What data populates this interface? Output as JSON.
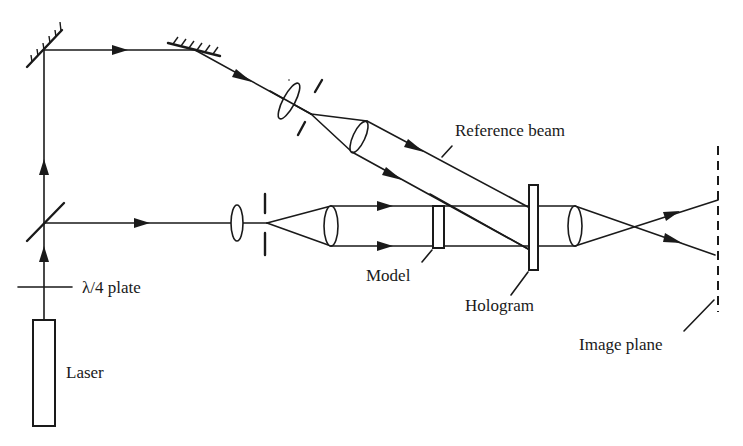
{
  "diagram": {
    "type": "optical-setup",
    "colors": {
      "ink": "#1a1a1a",
      "background": "#ffffff"
    },
    "labels": {
      "reference_beam": "Reference beam",
      "quarter_wave_plate": "λ/4 plate",
      "model": "Model",
      "hologram": "Hologram",
      "image_plane": "Image plane",
      "laser": "Laser"
    },
    "components": [
      {
        "id": "laser",
        "kind": "source",
        "label": "Laser"
      },
      {
        "id": "qwp",
        "kind": "wave-plate",
        "label": "λ/4 plate"
      },
      {
        "id": "beam-splitter",
        "kind": "beam-splitter"
      },
      {
        "id": "mirror-1",
        "kind": "mirror"
      },
      {
        "id": "mirror-2",
        "kind": "mirror"
      },
      {
        "id": "ref-focus-lens",
        "kind": "lens"
      },
      {
        "id": "ref-pinhole",
        "kind": "pinhole"
      },
      {
        "id": "ref-collimator",
        "kind": "lens"
      },
      {
        "id": "obj-focus-lens",
        "kind": "lens"
      },
      {
        "id": "obj-pinhole",
        "kind": "pinhole"
      },
      {
        "id": "obj-collimator",
        "kind": "lens"
      },
      {
        "id": "model",
        "kind": "object",
        "label": "Model"
      },
      {
        "id": "hologram",
        "kind": "plate",
        "label": "Hologram"
      },
      {
        "id": "imaging-lens",
        "kind": "lens"
      },
      {
        "id": "image-plane",
        "kind": "screen",
        "label": "Image plane"
      }
    ]
  }
}
